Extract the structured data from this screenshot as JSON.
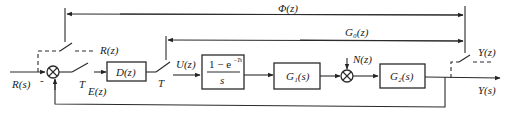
{
  "diagram": {
    "type": "sampled-data control system block diagram",
    "signals": {
      "input": "R(s)",
      "sampled_input": "R(z)",
      "error": "E(z)",
      "control": "U(z)",
      "disturbance": "N(z)",
      "output": "Y(s)",
      "sampled_output": "Y(z)"
    },
    "sampler_label_1": "T",
    "sampler_label_2": "T",
    "minus_sign": "-",
    "blocks": {
      "controller": "D(z)",
      "zoh_numerator_base": "1 − e",
      "zoh_numerator_exp": "−Ts",
      "zoh_denominator": "s",
      "plant1": "G₁(s)",
      "plant2": "G₂(s)"
    },
    "transfer_labels": {
      "closed_loop": "Φ(z)",
      "open_loop": "G₀(z)"
    }
  }
}
